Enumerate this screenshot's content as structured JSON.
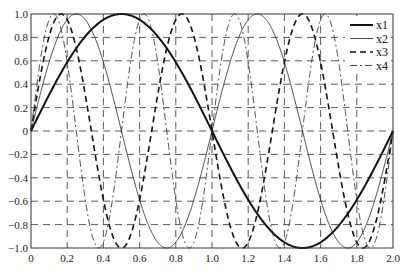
{
  "chart_data": {
    "type": "line",
    "title": "",
    "xlabel": "",
    "ylabel": "",
    "xlim": [
      0,
      2.0
    ],
    "ylim": [
      -1.0,
      1.0
    ],
    "grid": true,
    "grid_style": "dashed",
    "legend_position": "upper right",
    "x_ticks": [
      "0",
      "0.2",
      "0.4",
      "0.6",
      "0.8",
      "1.0",
      "1.2",
      "1.4",
      "1.6",
      "1.8",
      "2.0"
    ],
    "y_ticks": [
      "1.0",
      "0.8",
      "0.6",
      "0.4",
      "0.2",
      "0",
      "-0.2",
      "-0.4",
      "-0.6",
      "-0.8",
      "-1.0"
    ],
    "series": [
      {
        "name": "x1",
        "function": "sin(1*pi*t)",
        "k": 1,
        "style": "solid-thick"
      },
      {
        "name": "x2",
        "function": "sin(2*pi*t)",
        "k": 2,
        "style": "solid-thin"
      },
      {
        "name": "x3",
        "function": "sin(3*pi*t)",
        "k": 3,
        "style": "dashed"
      },
      {
        "name": "x4",
        "function": "sin(4*pi*t)",
        "k": 4,
        "style": "dash-dot"
      }
    ],
    "x": [
      0,
      0.1,
      0.2,
      0.3,
      0.4,
      0.5,
      0.6,
      0.7,
      0.8,
      0.9,
      1.0,
      1.1,
      1.2,
      1.3,
      1.4,
      1.5,
      1.6,
      1.7,
      1.8,
      1.9,
      2.0
    ],
    "values": {
      "x1": [
        0,
        0.31,
        0.59,
        0.81,
        0.95,
        1.0,
        0.95,
        0.81,
        0.59,
        0.31,
        0,
        -0.31,
        -0.59,
        -0.81,
        -0.95,
        -1.0,
        -0.95,
        -0.81,
        -0.59,
        -0.31,
        0
      ],
      "x2": [
        0,
        0.59,
        0.95,
        0.95,
        0.59,
        0,
        -0.59,
        -0.95,
        -0.95,
        -0.59,
        0,
        0.59,
        0.95,
        0.95,
        0.59,
        0,
        -0.59,
        -0.95,
        -0.95,
        -0.59,
        0
      ],
      "x3": [
        0,
        0.81,
        0.95,
        0.31,
        -0.59,
        -1.0,
        -0.59,
        0.31,
        0.95,
        0.81,
        0,
        -0.81,
        -0.95,
        -0.31,
        0.59,
        1.0,
        0.59,
        -0.31,
        -0.95,
        -0.81,
        0
      ],
      "x4": [
        0,
        0.95,
        0.59,
        -0.59,
        -0.95,
        0,
        0.95,
        0.59,
        -0.59,
        -0.95,
        0,
        0.95,
        0.59,
        -0.59,
        -0.95,
        0,
        0.95,
        0.59,
        -0.59,
        -0.95,
        0
      ]
    }
  },
  "legend": {
    "items": [
      {
        "label": "x1"
      },
      {
        "label": "x2"
      },
      {
        "label": "x3"
      },
      {
        "label": "x4"
      }
    ]
  }
}
